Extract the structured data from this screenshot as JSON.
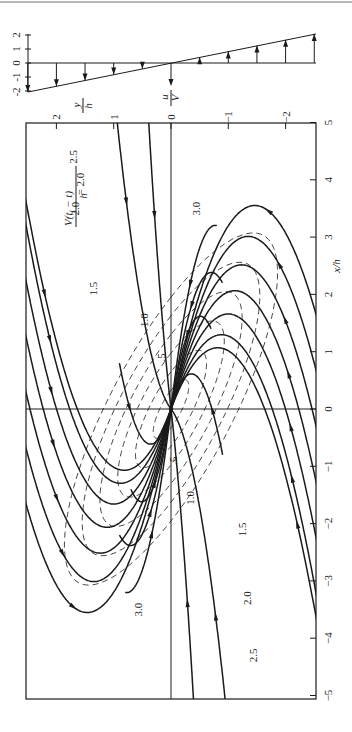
{
  "figure": {
    "top_rule_color": "#b8b8b8",
    "ink_color": "#1a1a1a",
    "background": "#ffffff",
    "origin_px": [
      171,
      409
    ],
    "px_per_unit": 57.3
  },
  "velocity_profile": {
    "label_u": "u",
    "label_V": "V",
    "scale_ticks": [
      "-2",
      "-1",
      "0",
      "1",
      "2"
    ],
    "arrows_y_over_h": [
      2.5,
      2.0,
      1.5,
      1.0,
      0.5,
      0.0,
      -0.5,
      -1.0,
      -1.5,
      -2.0,
      -2.5
    ],
    "u_over_V": [
      -2.5,
      -2.0,
      -1.5,
      -1.0,
      -0.5,
      0.0,
      0.5,
      1.0,
      1.5,
      2.0,
      2.5
    ]
  },
  "chart_data": {
    "type": "diagram",
    "title": "",
    "xlabel": "x/h",
    "ylabel": "y/h",
    "x_ticks": [
      "5",
      "4",
      "3",
      "2",
      "1",
      "0",
      "-1",
      "-2",
      "-3",
      "-4",
      "-5"
    ],
    "y_ticks": [
      "2",
      "1",
      "0",
      "-1",
      "-2"
    ],
    "xlim": [
      -5,
      5
    ],
    "ylim": [
      -2.5,
      2.5
    ],
    "orientation": "rotated 90°: x/h runs vertically (up positive), y/h runs horizontally (left positive)",
    "contour_expression": "V(t_f − t)/h",
    "contour_levels": [
      0.5,
      1.0,
      1.5,
      2.0,
      2.5,
      3.0
    ],
    "contour_labels": [
      {
        "text": ".5",
        "x_over_h": 0.9,
        "y_over_h": 0.1
      },
      {
        "text": "1.0",
        "x_over_h": 1.55,
        "y_over_h": 0.4
      },
      {
        "text": "1.5",
        "x_over_h": 2.1,
        "y_over_h": 1.3
      },
      {
        "text": "2.0",
        "x_over_h": 3.5,
        "y_over_h": 1.6
      },
      {
        "text": "2.5",
        "x_over_h": 4.4,
        "y_over_h": 1.65
      },
      {
        "text": "3.0",
        "x_over_h": 3.5,
        "y_over_h": -0.5
      },
      {
        "text": ".5",
        "x_over_h": -0.9,
        "y_over_h": -0.1
      },
      {
        "text": "1.0",
        "x_over_h": -1.55,
        "y_over_h": -0.4
      },
      {
        "text": "1.5",
        "x_over_h": -2.1,
        "y_over_h": -1.3
      },
      {
        "text": "2.0",
        "x_over_h": -3.3,
        "y_over_h": -1.4
      },
      {
        "text": "2.5",
        "x_over_h": -4.3,
        "y_over_h": -1.5
      },
      {
        "text": "3.0",
        "x_over_h": -3.5,
        "y_over_h": 0.5
      }
    ],
    "streamlines": "trajectories converging to the origin node (0,0) in a simple shear flow u/V = −y/h; arrows indicate direction of motion",
    "shear_profile": {
      "y_over_h": [
        2.5,
        0,
        -2.5
      ],
      "u_over_V": [
        -2.5,
        0,
        2.5
      ]
    }
  },
  "labels": {
    "x_axis": "x/h",
    "y_axis_num": "y",
    "y_axis_den": "h",
    "contour_formula_num": "V(t",
    "contour_formula_sub": "f",
    "contour_formula_rest": " − t)",
    "contour_formula_den": "h",
    "contour_formula_value": "= 2.0"
  }
}
